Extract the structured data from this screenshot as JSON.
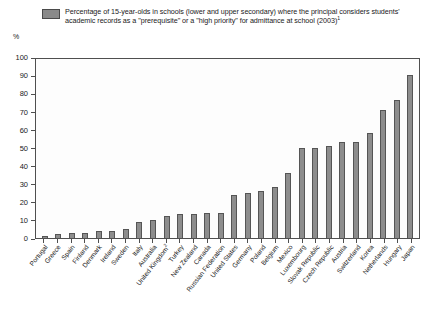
{
  "legend": {
    "swatch_color": "#8a8a8a",
    "text": "Percentage of 15-year-olds in schools (lower and upper secondary) where the principal considers students' academic records as a \"prerequisite\" or a \"high priority\" for admittance at school (2003)",
    "footnote_marker": "1"
  },
  "axis": {
    "y_unit": "%",
    "y_ticks": [
      "0",
      "10",
      "20",
      "30",
      "40",
      "50",
      "60",
      "70",
      "80",
      "90",
      "100"
    ]
  },
  "chart_data": {
    "type": "bar",
    "title": "Percentage of 15-year-olds in schools (lower and upper secondary) where the principal considers students' academic records as a \"prerequisite\" or a \"high priority\" for admittance at school (2003)",
    "xlabel": "",
    "ylabel": "%",
    "ylim": [
      0,
      100
    ],
    "ytick_step": 10,
    "grid": false,
    "legend_position": "top",
    "series_name": "Percentage of 15-year-olds",
    "bar_color": "#8d8d8d",
    "categories": [
      "Portugal",
      "Greece",
      "Spain",
      "Finland",
      "Denmark",
      "Ireland",
      "Sweden",
      "Italy",
      "Australia",
      "United Kingdom",
      "Turkey",
      "New Zealand",
      "Canada",
      "Russian Federation",
      "United States",
      "Germany",
      "Poland",
      "Belgium",
      "Mexico",
      "Luxembourg",
      "Slovak Republic",
      "Czech Republic",
      "Austria",
      "Switzerland",
      "Korea",
      "Netherlands",
      "Hungary",
      "Japan"
    ],
    "category_footnotes": {
      "United Kingdom": "2"
    },
    "values": [
      1,
      2,
      3,
      3,
      4,
      4,
      5,
      9,
      10,
      12,
      13,
      13,
      14,
      14,
      24,
      25,
      26,
      28,
      36,
      50,
      50,
      51,
      53,
      53,
      58,
      71,
      76,
      90
    ],
    "values_unit": "%"
  }
}
